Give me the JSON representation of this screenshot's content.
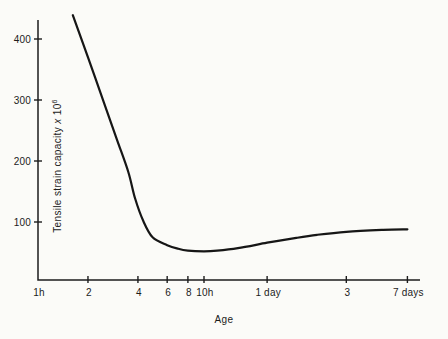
{
  "figure": {
    "background": "#fbfbf8",
    "ink": "#1c1c1c",
    "curve_color": "#161616",
    "xlabel": "Age",
    "ylabel_text": "Tensile strain capacity",
    "ylabel_times": "x",
    "ylabel_base": "10",
    "ylabel_exponent": "6"
  },
  "chart_data": {
    "type": "line",
    "title": "",
    "xlabel": "Age",
    "ylabel": "Tensile strain capacity x 10^6",
    "x_scale": "log",
    "x_unit": "hours",
    "xlim_hours": [
      1,
      200
    ],
    "ylim": [
      0,
      450
    ],
    "grid": false,
    "legend": false,
    "y_ticks": [
      {
        "value": 100,
        "label": "100"
      },
      {
        "value": 200,
        "label": "200"
      },
      {
        "value": 300,
        "label": "300"
      },
      {
        "value": 400,
        "label": "400"
      }
    ],
    "x_ticks": [
      {
        "hours": 1,
        "label": "1h",
        "has_mark": false
      },
      {
        "hours": 2,
        "label": "2",
        "has_mark": true
      },
      {
        "hours": 4,
        "label": "4",
        "has_mark": true
      },
      {
        "hours": 6,
        "label": "6",
        "has_mark": true
      },
      {
        "hours": 8,
        "label": "8",
        "has_mark": true
      },
      {
        "hours": 10,
        "label": "10h",
        "has_mark": true
      },
      {
        "hours": 24,
        "label": "1 day",
        "has_mark": true
      },
      {
        "hours": 72,
        "label": "3",
        "has_mark": true
      },
      {
        "hours": 168,
        "label": "7 days",
        "has_mark": true
      }
    ],
    "series": [
      {
        "name": "tensile strain capacity",
        "points_hours_value": [
          [
            1.62,
            439
          ],
          [
            2,
            370
          ],
          [
            2.5,
            295
          ],
          [
            3,
            234
          ],
          [
            3.5,
            182
          ],
          [
            3.85,
            138
          ],
          [
            4.3,
            102
          ],
          [
            4.9,
            75
          ],
          [
            6,
            62
          ],
          [
            7,
            56
          ],
          [
            8,
            53
          ],
          [
            10,
            52
          ],
          [
            12,
            53
          ],
          [
            16,
            57
          ],
          [
            24,
            66
          ],
          [
            36,
            74
          ],
          [
            48,
            79
          ],
          [
            72,
            84
          ],
          [
            120,
            87
          ],
          [
            168,
            88
          ]
        ]
      }
    ]
  }
}
